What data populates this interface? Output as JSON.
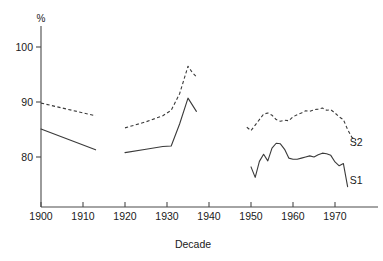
{
  "chart_data": {
    "type": "line",
    "title": "",
    "subtitle": "",
    "xlabel": "Decade",
    "ylabel": "%",
    "ylabel_position": "above-axis",
    "xlim": [
      1896,
      1978
    ],
    "ylim": [
      73,
      103
    ],
    "grid": false,
    "legend": "inline-right-end-labels",
    "x_ticks": [
      1900,
      1910,
      1920,
      1930,
      1940,
      1950,
      1960,
      1970
    ],
    "x_tick_labels": [
      "1900",
      "1910",
      "1920",
      "1930",
      "1940",
      "1950",
      "1960",
      "1970"
    ],
    "y_ticks": [
      80,
      90,
      100
    ],
    "y_tick_labels": [
      "80",
      "90",
      "100"
    ],
    "series": [
      {
        "name": "S2",
        "label": "S2",
        "style": "dashed",
        "color": "#3a3a3a",
        "label_x": 1973.5,
        "label_y": 82.6,
        "segments": [
          {
            "note": "1900-1913",
            "x": [
              1900,
              1913
            ],
            "values": [
              89.8,
              87.5
            ]
          },
          {
            "note": "1920-1937",
            "x": [
              1920,
              1925,
              1929,
              1931,
              1933,
              1935,
              1936,
              1937
            ],
            "values": [
              85.3,
              86.4,
              87.5,
              88.5,
              91.5,
              96.5,
              95.4,
              94.6
            ]
          },
          {
            "note": "1949-1975",
            "x": [
              1949,
              1950,
              1951,
              1952,
              1953,
              1954,
              1955,
              1956,
              1957,
              1958,
              1959,
              1960,
              1961,
              1962,
              1963,
              1964,
              1965,
              1966,
              1967,
              1968,
              1969,
              1970,
              1971,
              1972,
              1973,
              1974,
              1975
            ],
            "values": [
              85.4,
              84.8,
              85.8,
              86.8,
              87.8,
              88.0,
              87.6,
              86.8,
              86.5,
              86.7,
              86.6,
              87.3,
              87.7,
              88.0,
              88.4,
              88.3,
              88.6,
              88.7,
              88.9,
              88.5,
              88.6,
              88.0,
              87.3,
              86.8,
              85.0,
              83.6,
              83.0
            ]
          }
        ]
      },
      {
        "name": "S1",
        "label": "S1",
        "style": "solid",
        "color": "#3a3a3a",
        "label_x": 1973.5,
        "label_y": 75.8,
        "segments": [
          {
            "note": "1900-1913",
            "x": [
              1900,
              1913
            ],
            "values": [
              85.1,
              81.3
            ]
          },
          {
            "note": "1920-1937",
            "x": [
              1920,
              1925,
              1929,
              1931,
              1933,
              1935,
              1937
            ],
            "values": [
              80.8,
              81.4,
              81.9,
              82.0,
              86.0,
              90.7,
              88.3
            ]
          },
          {
            "note": "1950-1973",
            "x": [
              1950,
              1951,
              1952,
              1953,
              1954,
              1955,
              1956,
              1957,
              1958,
              1959,
              1960,
              1961,
              1962,
              1963,
              1964,
              1965,
              1966,
              1967,
              1968,
              1969,
              1970,
              1971,
              1972,
              1973
            ],
            "values": [
              78.2,
              76.3,
              79.2,
              80.5,
              79.3,
              81.6,
              82.5,
              82.4,
              81.4,
              79.8,
              79.6,
              79.6,
              79.8,
              80.0,
              80.2,
              80.0,
              80.4,
              80.7,
              80.6,
              80.3,
              79.1,
              78.4,
              78.8,
              74.6
            ]
          }
        ]
      }
    ]
  },
  "axes": {
    "y_unit": "%",
    "x_title": "Decade"
  }
}
